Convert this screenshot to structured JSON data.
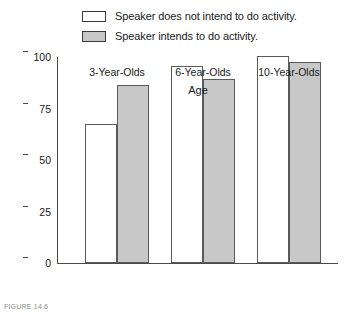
{
  "chart_data": {
    "type": "bar",
    "title": "",
    "xlabel": "Age",
    "ylabel": "Percent Correct Choice of Scenario Outcome",
    "categories": [
      "3-Year-Olds",
      "6-Year-Olds",
      "10-Year-Olds"
    ],
    "series": [
      {
        "name": "Speaker does not intend to do activity.",
        "color": "#ffffff",
        "values": [
          67,
          95,
          100
        ]
      },
      {
        "name": "Speaker intends to do activity.",
        "color": "#c8c8c8",
        "values": [
          86,
          89,
          97
        ]
      }
    ],
    "ylim": [
      0,
      100
    ],
    "yticks": [
      0,
      25,
      50,
      75,
      100
    ],
    "ytick_labels": [
      "0",
      "25",
      "50",
      "75",
      "100"
    ],
    "grid": false,
    "legend_position": "top"
  },
  "legend": {
    "items": [
      {
        "label": "Speaker does not intend to do activity.",
        "swatch": "white"
      },
      {
        "label": "Speaker intends to do activity.",
        "swatch": "gray"
      }
    ]
  },
  "axes": {
    "y_title": "Percent Correct Choice of Scenario Outcome",
    "x_title": "Age",
    "y_ticks": [
      "100",
      "75",
      "50",
      "25",
      "0"
    ],
    "x_labels": [
      "3-Year-Olds",
      "6-Year-Olds",
      "10-Year-Olds"
    ]
  },
  "caption": {
    "text": "FIGURE 14.6"
  },
  "colors": {
    "bar_white": "#ffffff",
    "bar_gray": "#c8c8c8",
    "axis": "#4a4a4a",
    "text": "#1a1a1a"
  }
}
